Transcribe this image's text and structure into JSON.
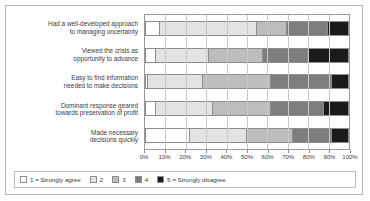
{
  "chart_data": {
    "type": "bar",
    "orientation": "horizontal",
    "stacked": true,
    "stack_unit": "percent",
    "title": "",
    "subtitle": "",
    "xlabel": "",
    "ylabel": "",
    "xlim": [
      0,
      100
    ],
    "grid": true,
    "legend_position": "bottom",
    "xticks": [
      0,
      10,
      20,
      30,
      40,
      50,
      60,
      70,
      80,
      90,
      100
    ],
    "xtick_labels": [
      "0%",
      "10%",
      "20%",
      "30%",
      "40%",
      "50%",
      "60%",
      "70%",
      "80%",
      "90%",
      "100%"
    ],
    "categories": [
      "Had a well-developed approach to managing uncertainty",
      "Viewed the crisis as opportunity to advance",
      "Easy to find information needed to make decisions",
      "Dominant response geared towards preservation of profit",
      "Made necessary decisions quickly"
    ],
    "category_lines": [
      [
        "Had a well-developed approach",
        "to managing uncertainty"
      ],
      [
        "Viewed the crisis as",
        "opportunity to advance"
      ],
      [
        "Easy to find information",
        "needed to make decisions"
      ],
      [
        "Dominant response geared",
        "towards preservation of profit"
      ],
      [
        "Made necessary",
        "decisions quickly"
      ]
    ],
    "series": [
      {
        "name": "1 = Strongly agree",
        "color": "#ffffff",
        "values": [
          7,
          5,
          1,
          5,
          22
        ]
      },
      {
        "name": "2",
        "color": "#e3e3e3",
        "values": [
          48,
          26,
          27,
          28,
          28
        ]
      },
      {
        "name": "3",
        "color": "#bdbdbd",
        "values": [
          15,
          27,
          34,
          29,
          23
        ]
      },
      {
        "name": "4",
        "color": "#7d7d7d",
        "values": [
          20,
          22,
          30,
          26,
          19
        ]
      },
      {
        "name": "5 = Strongly disagree",
        "color": "#1a1a1a",
        "values": [
          10,
          20,
          8,
          12,
          8
        ]
      }
    ],
    "legend": [
      {
        "label": "1 = Strongly agree",
        "color": "#ffffff"
      },
      {
        "label": "2",
        "color": "#e3e3e3"
      },
      {
        "label": "3",
        "color": "#bdbdbd"
      },
      {
        "label": "4",
        "color": "#7d7d7d"
      },
      {
        "label": "5 = Strongly disagree",
        "color": "#1a1a1a"
      }
    ]
  }
}
